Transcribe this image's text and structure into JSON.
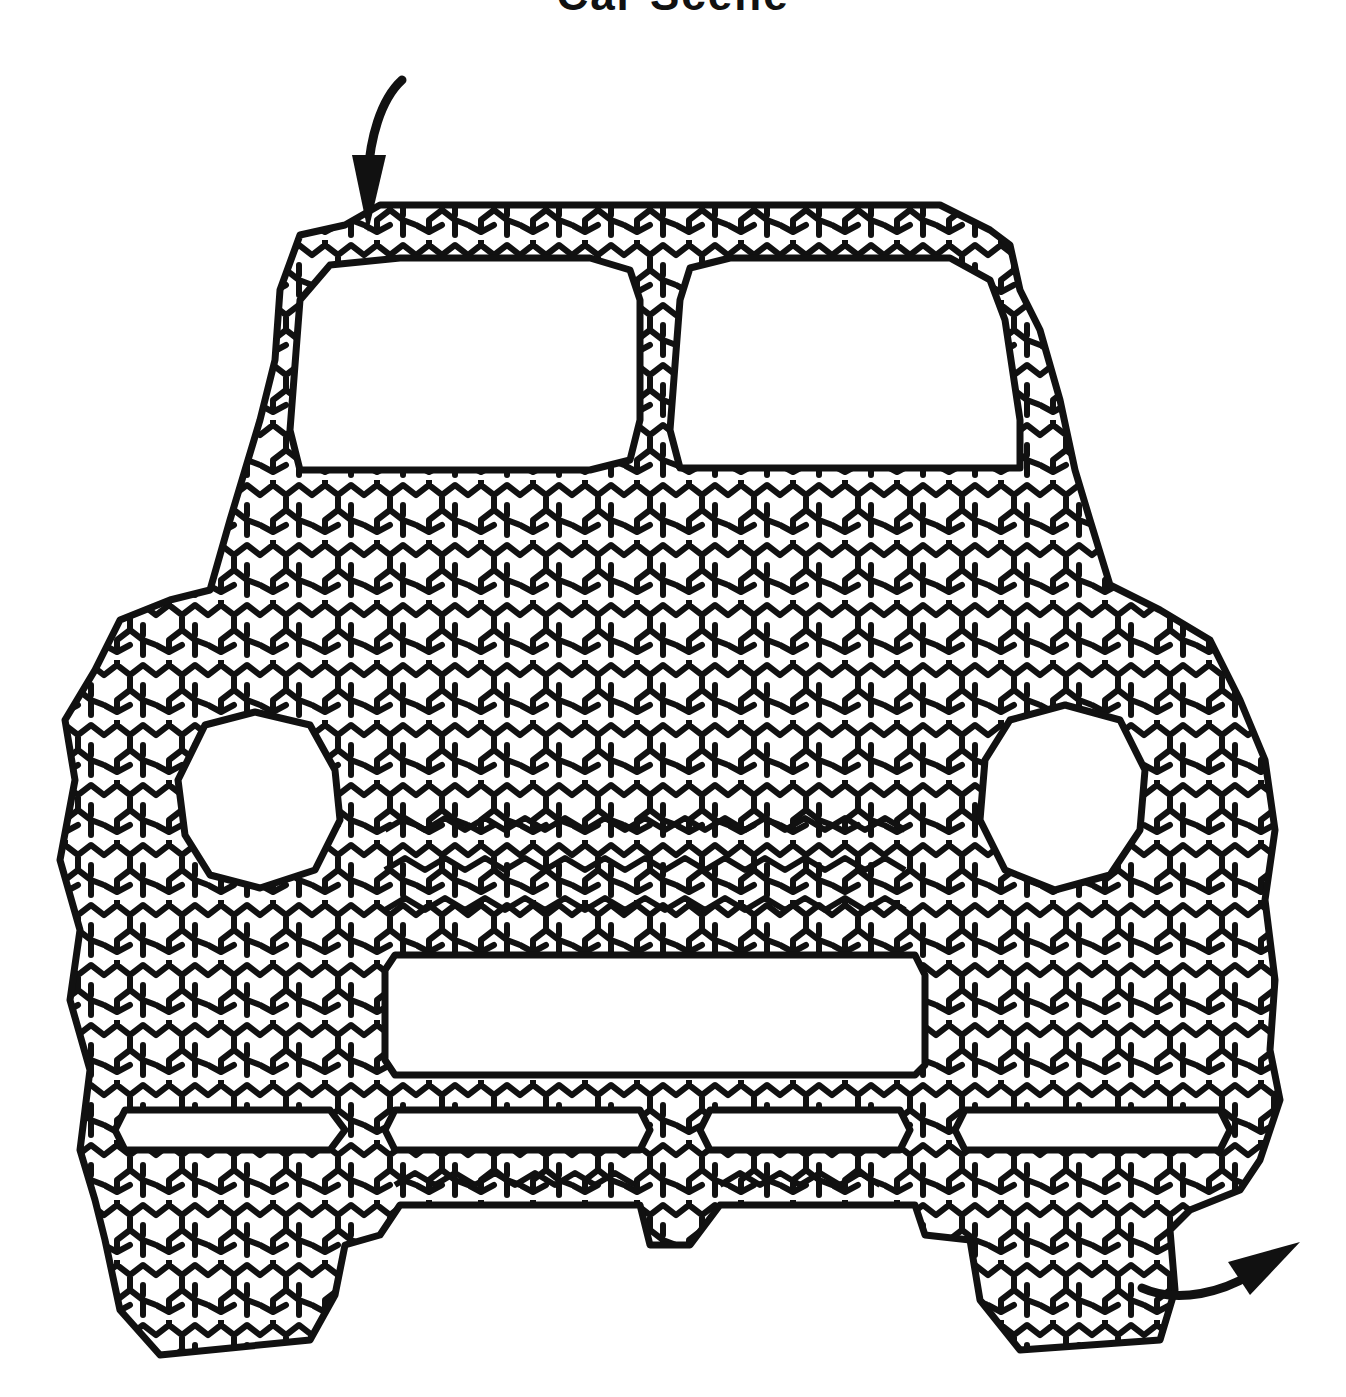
{
  "page": {
    "title": "Car Scene",
    "title_visible": "partially clipped at top edge"
  },
  "maze": {
    "subject": "front view of a car",
    "style": "hexagonal-cell maze with thick black walls",
    "wall_color": "#111111",
    "background_color": "#ffffff",
    "entry": {
      "label": "start",
      "icon": "curved-arrow-down-icon",
      "position": "top-left, above roof"
    },
    "exit": {
      "label": "finish",
      "icon": "curved-arrow-up-right-icon",
      "position": "bottom-right, beside right wheel"
    },
    "cutouts": [
      {
        "name": "left-window"
      },
      {
        "name": "right-window"
      },
      {
        "name": "left-headlight"
      },
      {
        "name": "right-headlight"
      },
      {
        "name": "grille"
      },
      {
        "name": "bumper-slot-1"
      },
      {
        "name": "bumper-slot-2"
      },
      {
        "name": "bumper-slot-3"
      },
      {
        "name": "bumper-slot-4"
      }
    ]
  }
}
